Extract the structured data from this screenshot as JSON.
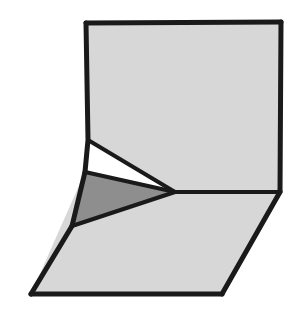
{
  "figure": {
    "canvas": {
      "width": 305,
      "height": 329,
      "background": "#ffffff"
    },
    "colors": {
      "outline": "#1a1a1a",
      "fill_light": "#d7d7d7",
      "fill_medium": "#8e8e8e",
      "fill_white": "#ffffff",
      "background": "#ffffff"
    },
    "stroke": {
      "outer_width": 5,
      "inner_width": 4
    },
    "vertices": {
      "A": {
        "label": "top-left",
        "x": 86,
        "y": 23
      },
      "B": {
        "label": "top-right",
        "x": 281,
        "y": 22
      },
      "C": {
        "label": "right-mid",
        "x": 280,
        "y": 192
      },
      "D": {
        "label": "bottom-right",
        "x": 222,
        "y": 294
      },
      "E": {
        "label": "bottom-left",
        "x": 31,
        "y": 294
      },
      "F": {
        "label": "left-upper-fold",
        "x": 88,
        "y": 140
      },
      "G": {
        "label": "left-junction",
        "x": 85,
        "y": 172
      },
      "H": {
        "label": "lower-junction",
        "x": 72,
        "y": 226
      },
      "I": {
        "label": "apex",
        "x": 175,
        "y": 192
      }
    },
    "faces": [
      {
        "name": "upper-panel",
        "fill": "#d7d7d7",
        "points": "86,23 281,22 280,192 175,192 85,172 88,140"
      },
      {
        "name": "sliver-triangle",
        "fill": "#ffffff",
        "points": "88,140 175,192 85,172"
      },
      {
        "name": "dark-triangle",
        "fill": "#8e8e8e",
        "points": "85,172 175,192 72,226"
      },
      {
        "name": "lower-panel",
        "fill": "#d7d7d7",
        "points": "72,226 175,192 280,192 222,294 31,294"
      },
      {
        "name": "left-wedge",
        "fill": "#d7d7d7",
        "points": "85,172 72,226 31,294"
      }
    ],
    "edges": [
      {
        "name": "top-edge",
        "from": "A",
        "to": "B",
        "kind": "outer",
        "d": "M86,23 L281,22"
      },
      {
        "name": "right-upper-edge",
        "from": "B",
        "to": "C",
        "kind": "outer",
        "d": "M281,22 L280,192"
      },
      {
        "name": "right-lower-edge",
        "from": "C",
        "to": "D",
        "kind": "outer",
        "d": "M280,192 L222,294"
      },
      {
        "name": "bottom-edge",
        "from": "D",
        "to": "E",
        "kind": "outer",
        "d": "M222,294 L31,294"
      },
      {
        "name": "left-lower-edge",
        "from": "E",
        "to": "H",
        "kind": "outer",
        "d": "M31,294 L72,226"
      },
      {
        "name": "left-wedge-edge",
        "from": "H",
        "to": "G",
        "kind": "outer",
        "d": "M72,226 L85,172"
      },
      {
        "name": "left-upper-edge",
        "from": "G",
        "to": "A",
        "kind": "outer",
        "d": "M85,172 L88,140 L86,23"
      },
      {
        "name": "fold-crease-upper",
        "from": "F",
        "to": "I",
        "kind": "inner",
        "d": "M88,140 L175,192"
      },
      {
        "name": "fold-crease-middle",
        "from": "G",
        "to": "I",
        "kind": "inner",
        "d": "M85,172 L175,192"
      },
      {
        "name": "fold-crease-lower",
        "from": "H",
        "to": "I",
        "kind": "inner",
        "d": "M72,226 L175,192"
      },
      {
        "name": "horizon-crease",
        "from": "I",
        "to": "C",
        "kind": "inner",
        "d": "M175,192 L280,192"
      }
    ]
  }
}
